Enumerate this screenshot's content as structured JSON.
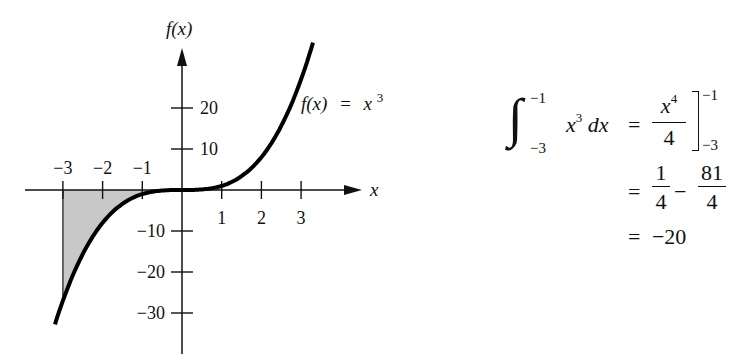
{
  "chart_data": {
    "type": "line",
    "title": "",
    "function_label": "f(x) = x^3",
    "xlabel": "x",
    "ylabel": "f(x)",
    "xlim": [
      -3.2,
      3.6
    ],
    "ylim": [
      -38,
      37
    ],
    "x_ticks": [
      -3,
      -2,
      -1,
      1,
      2,
      3
    ],
    "x_tick_labels": [
      "−3",
      "−2",
      "−1",
      "1",
      "2",
      "3"
    ],
    "y_ticks": [
      20,
      10,
      -10,
      -20,
      -30
    ],
    "y_tick_labels": [
      "20",
      "10",
      "−10",
      "−20",
      "−30"
    ],
    "series": [
      {
        "name": "f(x) = x^3",
        "x": [
          -3.2,
          -3,
          -2.5,
          -2,
          -1.5,
          -1,
          -0.5,
          0,
          0.5,
          1,
          1.5,
          2,
          2.5,
          3,
          3.3
        ],
        "values": [
          -32.8,
          -27,
          -15.6,
          -8,
          -3.4,
          -1,
          -0.1,
          0,
          0.1,
          1,
          3.4,
          8,
          15.6,
          27,
          35.9
        ]
      }
    ],
    "shaded_region": {
      "from": -3,
      "to": -1,
      "between": "curve and x-axis",
      "color": "#c8c8c8"
    },
    "grid": false,
    "legend": "none"
  },
  "labels": {
    "y_axis": "f(x)",
    "x_axis": "x",
    "curve": {
      "lhs": "f(x)",
      "eq": "=",
      "base": "x",
      "exp": "3"
    }
  },
  "equation": {
    "integral": {
      "lower": "−3",
      "upper": "−1",
      "integrand_base": "x",
      "integrand_exp": "3",
      "differential": "dx"
    },
    "line1": {
      "eq": "=",
      "num_base": "x",
      "num_exp": "4",
      "den": "4",
      "eval_upper": "−1",
      "eval_lower": "−3"
    },
    "line2": {
      "eq": "=",
      "frac1_num": "1",
      "frac1_den": "4",
      "minus": "−",
      "frac2_num": "81",
      "frac2_den": "4"
    },
    "line3": {
      "eq": "=",
      "value": "−20"
    }
  },
  "colors": {
    "curve": "#000000",
    "axis": "#111111",
    "shade": "#c8c8c8"
  }
}
